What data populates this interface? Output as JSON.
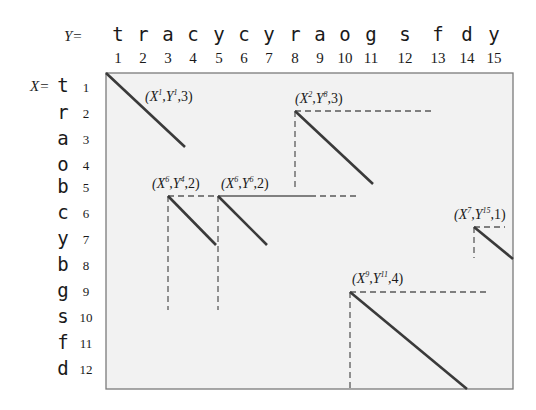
{
  "diagram": {
    "y_prefix": "Y=",
    "x_prefix": "X=",
    "y_sequence": [
      "t",
      "r",
      "a",
      "c",
      "y",
      "c",
      "y",
      "r",
      "a",
      "o",
      "g",
      "s",
      "f",
      "d",
      "y"
    ],
    "y_indices": [
      "1",
      "2",
      "3",
      "4",
      "5",
      "6",
      "7",
      "8",
      "9",
      "10",
      "11",
      "12",
      "13",
      "14",
      "15"
    ],
    "x_sequence": [
      "t",
      "r",
      "a",
      "o",
      "b",
      "c",
      "y",
      "b",
      "g",
      "s",
      "f",
      "d"
    ],
    "x_indices": [
      "1",
      "2",
      "3",
      "4",
      "5",
      "6",
      "7",
      "8",
      "9",
      "10",
      "11",
      "12"
    ],
    "matches": [
      {
        "label_base": "(X",
        "x_sup": "1",
        "mid": ",Y",
        "y_sup": "1",
        "len": ",3)",
        "x": 1,
        "y": 1,
        "length": 3
      },
      {
        "label_base": "(X",
        "x_sup": "2",
        "mid": ",Y",
        "y_sup": "8",
        "len": ",3)",
        "x": 2,
        "y": 8,
        "length": 3
      },
      {
        "label_base": "(X",
        "x_sup": "6",
        "mid": ",Y",
        "y_sup": "4",
        "len": ",2)",
        "x": 6,
        "y": 4,
        "length": 2
      },
      {
        "label_base": "(X",
        "x_sup": "6",
        "mid": ",Y",
        "y_sup": "6",
        "len": ",2)",
        "x": 6,
        "y": 6,
        "length": 2
      },
      {
        "label_base": "(X",
        "x_sup": "7",
        "mid": ",Y",
        "y_sup": "15",
        "len": ",1)",
        "x": 7,
        "y": 15,
        "length": 1
      },
      {
        "label_base": "(X",
        "x_sup": "9",
        "mid": ",Y",
        "y_sup": "11",
        "len": ",4)",
        "x": 9,
        "y": 11,
        "length": 4
      }
    ]
  }
}
